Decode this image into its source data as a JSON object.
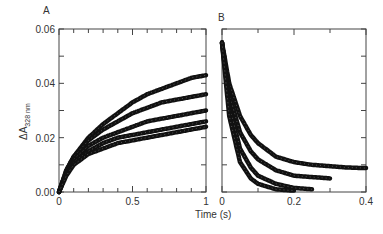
{
  "figure": {
    "xlabel": "Time (s)",
    "ylabel_main": "ΔA",
    "ylabel_sub": "328 nm"
  },
  "chart_data": [
    {
      "panel": "A",
      "type": "scatter",
      "title": "",
      "xlabel": "Time (s)",
      "ylabel": "ΔA328 nm",
      "xlim": [
        0,
        1
      ],
      "ylim": [
        0,
        0.06
      ],
      "xticks": [
        "0",
        "0.5",
        "1"
      ],
      "yticks": [
        "0.00",
        "0.02",
        "0.04",
        "0.06"
      ],
      "grid": false,
      "legend": null,
      "series": [
        {
          "name": "trace 1",
          "x": [
            0,
            0.05,
            0.1,
            0.2,
            0.3,
            0.4,
            0.5,
            0.6,
            0.7,
            0.8,
            0.9,
            1.0
          ],
          "values": [
            0,
            0.008,
            0.013,
            0.02,
            0.025,
            0.029,
            0.033,
            0.036,
            0.038,
            0.04,
            0.042,
            0.043
          ]
        },
        {
          "name": "trace 2",
          "x": [
            0,
            0.05,
            0.1,
            0.2,
            0.3,
            0.4,
            0.5,
            0.6,
            0.7,
            0.8,
            0.9,
            1.0
          ],
          "values": [
            0,
            0.008,
            0.013,
            0.019,
            0.023,
            0.026,
            0.029,
            0.031,
            0.033,
            0.034,
            0.035,
            0.036
          ]
        },
        {
          "name": "trace 3",
          "x": [
            0,
            0.05,
            0.1,
            0.2,
            0.3,
            0.4,
            0.5,
            0.6,
            0.7,
            0.8,
            0.9,
            1.0
          ],
          "values": [
            0,
            0.007,
            0.012,
            0.017,
            0.02,
            0.022,
            0.024,
            0.026,
            0.027,
            0.028,
            0.029,
            0.03
          ]
        },
        {
          "name": "trace 4",
          "x": [
            0,
            0.05,
            0.1,
            0.2,
            0.3,
            0.4,
            0.5,
            0.6,
            0.7,
            0.8,
            0.9,
            1.0
          ],
          "values": [
            0,
            0.007,
            0.011,
            0.015,
            0.018,
            0.02,
            0.021,
            0.022,
            0.023,
            0.024,
            0.025,
            0.026
          ]
        },
        {
          "name": "trace 5",
          "x": [
            0,
            0.05,
            0.1,
            0.2,
            0.3,
            0.4,
            0.5,
            0.6,
            0.7,
            0.8,
            0.9,
            1.0
          ],
          "values": [
            0,
            0.006,
            0.01,
            0.014,
            0.016,
            0.018,
            0.019,
            0.02,
            0.021,
            0.022,
            0.023,
            0.024
          ]
        }
      ]
    },
    {
      "panel": "B",
      "type": "scatter",
      "title": "",
      "xlabel": "Time (s)",
      "ylabel": "",
      "xlim": [
        0,
        0.4
      ],
      "ylim": [
        0,
        0.06
      ],
      "xticks": [
        "0",
        "0.2",
        "0.4"
      ],
      "yticks": [],
      "grid": false,
      "legend": null,
      "series": [
        {
          "name": "trace 1",
          "x": [
            0,
            0.02,
            0.05,
            0.08,
            0.1,
            0.15,
            0.2,
            0.25,
            0.3,
            0.35,
            0.4
          ],
          "values": [
            0.055,
            0.04,
            0.028,
            0.021,
            0.018,
            0.013,
            0.011,
            0.01,
            0.0095,
            0.009,
            0.0088
          ]
        },
        {
          "name": "trace 2",
          "x": [
            0,
            0.02,
            0.05,
            0.08,
            0.1,
            0.15,
            0.2,
            0.25,
            0.3
          ],
          "values": [
            0.055,
            0.036,
            0.022,
            0.015,
            0.012,
            0.008,
            0.006,
            0.0055,
            0.005
          ]
        },
        {
          "name": "trace 3",
          "x": [
            0,
            0.02,
            0.05,
            0.08,
            0.1,
            0.15,
            0.2,
            0.25
          ],
          "values": [
            0.055,
            0.032,
            0.016,
            0.009,
            0.006,
            0.003,
            0.0015,
            0.001
          ]
        },
        {
          "name": "trace 4",
          "x": [
            0,
            0.02,
            0.05,
            0.08,
            0.1,
            0.15,
            0.2
          ],
          "values": [
            0.055,
            0.028,
            0.011,
            0.005,
            0.003,
            0.001,
            0.0005
          ]
        }
      ]
    }
  ]
}
